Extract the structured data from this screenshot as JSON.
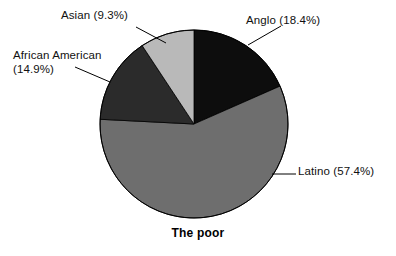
{
  "chart_data": {
    "type": "pie",
    "title": "The poor",
    "xlabel": "",
    "ylabel": "",
    "legend_position": "none",
    "grid": false,
    "labels": [
      "Anglo",
      "Latino",
      "African American",
      "Asian"
    ],
    "values": [
      18.4,
      57.4,
      14.9,
      9.3
    ],
    "value_unit": "%",
    "start_angle_deg": 0,
    "direction": "clockwise",
    "slices": [
      {
        "name": "Anglo",
        "value": 18.4,
        "label_text": "Anglo (18.4%)",
        "color": "#0d0d0d",
        "start_deg": 0,
        "sweep_deg": 66.24
      },
      {
        "name": "Latino",
        "value": 57.4,
        "label_text": "Latino (57.4%)",
        "color": "#6e6e6e",
        "start_deg": 66.24,
        "sweep_deg": 206.64
      },
      {
        "name": "African American",
        "value": 14.9,
        "label_line_1": "African American",
        "label_line_2": "(14.9%)",
        "label_text": "African American (14.9%)",
        "color": "#2b2b2b",
        "start_deg": 272.88,
        "sweep_deg": 53.64
      },
      {
        "name": "Asian",
        "value": 9.3,
        "label_text": "Asian (9.3%)",
        "color": "#b9b9b9",
        "start_deg": 326.52,
        "sweep_deg": 33.48
      }
    ]
  },
  "figure": {
    "background_color": "#ffffff",
    "outline_color": "#000000",
    "leader_line_color": "#000000"
  }
}
